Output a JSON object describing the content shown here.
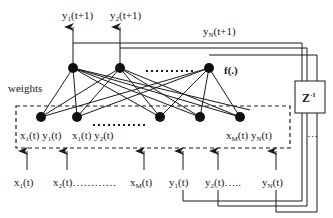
{
  "diagram": {
    "type": "recurrent neural network",
    "outputs": [
      {
        "label_main": "y",
        "label_sub": "1",
        "label_tail": "(t+1)"
      },
      {
        "label_main": "y",
        "label_sub": "2",
        "label_tail": "(t+1)"
      },
      {
        "label_main": "y",
        "label_sub": "N",
        "label_tail": "(t+1)"
      }
    ],
    "activation_label": "f(.)",
    "weights_label": "weights",
    "delay_block": {
      "label_main": "Z",
      "label_sup": "-1"
    },
    "input_node_labels": [
      {
        "text": "x",
        "sub": "1",
        "tail": "(t) "
      },
      {
        "text": "y",
        "sub": "1",
        "tail": "(t)"
      },
      {
        "text": "x",
        "sub": "1",
        "tail": "(t) "
      },
      {
        "text": "y",
        "sub": "2",
        "tail": "(t)"
      },
      {
        "text": "x",
        "sub": "M",
        "tail": "(t) "
      },
      {
        "text": "y",
        "sub": "N",
        "tail": "(t)"
      }
    ],
    "external_inputs": [
      {
        "text": "x",
        "sub": "1",
        "tail": "(t)"
      },
      {
        "text": "x",
        "sub": "2",
        "tail": "(t)…………"
      },
      {
        "text": "x",
        "sub": "M",
        "tail": "(t)"
      }
    ],
    "feedback_inputs": [
      {
        "text": "y",
        "sub": "1",
        "tail": "(t)"
      },
      {
        "text": "y",
        "sub": "2",
        "tail": "(t)….."
      },
      {
        "text": "y",
        "sub": "N",
        "tail": "(t)"
      }
    ],
    "ellipsis": "…",
    "colors": {
      "line": "#1a1a1a",
      "node": "#111111",
      "background": "#ffffff"
    }
  }
}
